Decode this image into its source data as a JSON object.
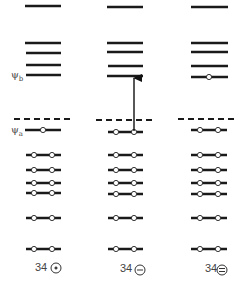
{
  "diagram": {
    "type": "molecular-orbital-energy-level-diagram",
    "labels": {
      "psi_b": {
        "symbol": "ψ",
        "sub": "b"
      },
      "psi_a": {
        "symbol": "ψ",
        "sub": "a"
      }
    },
    "columns": [
      {
        "id": "neutral",
        "caption_number": "34",
        "caption_symbol": "⊙",
        "charge": "neutral (radical)"
      },
      {
        "id": "anion",
        "caption_number": "34",
        "caption_symbol": "⊖",
        "charge": "anion"
      },
      {
        "id": "dianion",
        "caption_number": "34",
        "caption_symbol": "⊜",
        "charge": "dianion"
      }
    ],
    "levels": {
      "unoccupied_upper": [
        6,
        43,
        53,
        65
      ],
      "psi_b_level": 75,
      "nonbonding_dashed": 119,
      "psi_a_level": 131,
      "occupied_lower": [
        155,
        169,
        183,
        193,
        217,
        249
      ]
    },
    "occupancy": {
      "neutral": {
        "psi_b": 0,
        "psi_a": 1,
        "lower": 2
      },
      "anion": {
        "psi_b": 0,
        "psi_a": 2,
        "lower": 2
      },
      "dianion": {
        "psi_b": 1,
        "psi_a": 2,
        "lower": 2
      }
    },
    "transition_arrow": {
      "column": "anion",
      "from": "psi_a",
      "to": "psi_b"
    }
  }
}
